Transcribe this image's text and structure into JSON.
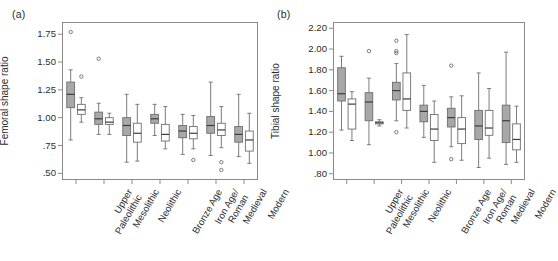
{
  "figure": {
    "panel_a_label": "(a)",
    "panel_b_label": "(b)"
  },
  "chart_data": [
    {
      "type": "box",
      "panel": "(a)",
      "title": "",
      "xlabel": "",
      "ylabel": "Femoral shape ratio",
      "ylim": [
        0.44,
        1.86
      ],
      "yticks": [
        0.5,
        0.75,
        1.0,
        1.25,
        1.5,
        1.75
      ],
      "ytick_labels": [
        ".50",
        ".75",
        "1.00",
        "1.25",
        "1.50",
        "1.75"
      ],
      "grid": false,
      "legend": "none",
      "categories": [
        "Upper Paleolithic",
        "Mesolithic",
        "Neolithic",
        "Bronze Age",
        "Iron Age/ Roman",
        "Medieval",
        "Modern"
      ],
      "category_label_lines": [
        [
          "Upper",
          "Paleolithic"
        ],
        [
          "Mesolithic",
          ""
        ],
        [
          "Neolithic",
          ""
        ],
        [
          "Bronze Age",
          ""
        ],
        [
          "Iron Age/",
          "Roman"
        ],
        [
          "Medieval",
          ""
        ],
        [
          "Modern",
          ""
        ]
      ],
      "series": [
        {
          "name": "male",
          "style": "shaded",
          "boxes": [
            {
              "category": "Upper Paleolithic",
              "whisker_low": 0.8,
              "q1": 1.09,
              "median": 1.21,
              "q3": 1.32,
              "whisker_high": 1.43,
              "outliers": [
                1.77
              ]
            },
            {
              "category": "Mesolithic",
              "whisker_low": 0.85,
              "q1": 0.94,
              "median": 0.99,
              "q3": 1.05,
              "whisker_high": 1.13,
              "outliers": [
                1.53
              ]
            },
            {
              "category": "Neolithic",
              "whisker_low": 0.6,
              "q1": 0.84,
              "median": 0.93,
              "q3": 1.0,
              "whisker_high": 1.21,
              "outliers": []
            },
            {
              "category": "Bronze Age",
              "whisker_low": 0.84,
              "q1": 0.95,
              "median": 0.99,
              "q3": 1.03,
              "whisker_high": 1.12,
              "outliers": []
            },
            {
              "category": "Iron Age/ Roman",
              "whisker_low": 0.67,
              "q1": 0.82,
              "median": 0.88,
              "q3": 0.93,
              "whisker_high": 1.03,
              "outliers": []
            },
            {
              "category": "Medieval",
              "whisker_low": 0.66,
              "q1": 0.86,
              "median": 0.93,
              "q3": 1.01,
              "whisker_high": 1.32,
              "outliers": []
            },
            {
              "category": "Modern",
              "whisker_low": 0.65,
              "q1": 0.78,
              "median": 0.85,
              "q3": 0.92,
              "whisker_high": 1.21,
              "outliers": []
            }
          ]
        },
        {
          "name": "female",
          "style": "open",
          "boxes": [
            {
              "category": "Upper Paleolithic",
              "whisker_low": 0.96,
              "q1": 1.03,
              "median": 1.07,
              "q3": 1.12,
              "whisker_high": 1.18,
              "outliers": [
                1.37
              ]
            },
            {
              "category": "Mesolithic",
              "whisker_low": 0.85,
              "q1": 0.94,
              "median": 0.96,
              "q3": 1.0,
              "whisker_high": 1.04,
              "outliers": []
            },
            {
              "category": "Neolithic",
              "whisker_low": 0.61,
              "q1": 0.78,
              "median": 0.86,
              "q3": 0.95,
              "whisker_high": 1.12,
              "outliers": []
            },
            {
              "category": "Bronze Age",
              "whisker_low": 0.72,
              "q1": 0.79,
              "median": 0.85,
              "q3": 0.94,
              "whisker_high": 1.1,
              "outliers": []
            },
            {
              "category": "Iron Age/ Roman",
              "whisker_low": 0.72,
              "q1": 0.81,
              "median": 0.86,
              "q3": 0.92,
              "whisker_high": 1.02,
              "outliers": [
                0.62
              ]
            },
            {
              "category": "Medieval",
              "whisker_low": 0.73,
              "q1": 0.84,
              "median": 0.89,
              "q3": 0.95,
              "whisker_high": 1.1,
              "outliers": [
                0.6,
                0.53
              ]
            },
            {
              "category": "Modern",
              "whisker_low": 0.59,
              "q1": 0.7,
              "median": 0.8,
              "q3": 0.88,
              "whisker_high": 1.04,
              "outliers": []
            }
          ]
        }
      ]
    },
    {
      "type": "box",
      "panel": "(b)",
      "title": "",
      "xlabel": "",
      "ylabel": "Tibial shape ratio",
      "ylim": [
        0.74,
        2.26
      ],
      "yticks": [
        0.8,
        1.0,
        1.2,
        1.4,
        1.6,
        1.8,
        2.0,
        2.2
      ],
      "ytick_labels": [
        ".80",
        "1.00",
        "1.20",
        "1.40",
        "1.60",
        "1.80",
        "2.00",
        "2.20"
      ],
      "grid": false,
      "legend": "none",
      "categories": [
        "Upper Paleolithic",
        "Mesolithic",
        "Neolithic",
        "Bronze Age",
        "Iron Age/ Roman",
        "Medieval",
        "Modern"
      ],
      "category_label_lines": [
        [
          "Upper",
          "Paleolithic"
        ],
        [
          "Mesolithic",
          ""
        ],
        [
          "Neolithic",
          ""
        ],
        [
          "Bronze Age",
          ""
        ],
        [
          "Iron Age/",
          "Roman"
        ],
        [
          "Medieval",
          ""
        ],
        [
          "Modern",
          ""
        ]
      ],
      "series": [
        {
          "name": "male",
          "style": "shaded",
          "boxes": [
            {
              "category": "Upper Paleolithic",
              "whisker_low": 1.22,
              "q1": 1.5,
              "median": 1.57,
              "q3": 1.82,
              "whisker_high": 1.93,
              "outliers": []
            },
            {
              "category": "Mesolithic",
              "whisker_low": 1.08,
              "q1": 1.31,
              "median": 1.49,
              "q3": 1.58,
              "whisker_high": 1.72,
              "outliers": [
                1.98
              ]
            },
            {
              "category": "Neolithic",
              "whisker_low": 1.31,
              "q1": 1.51,
              "median": 1.6,
              "q3": 1.68,
              "whisker_high": 1.86,
              "outliers": [
                2.08,
                1.98,
                1.96,
                1.2
              ]
            },
            {
              "category": "Bronze Age",
              "whisker_low": 1.15,
              "q1": 1.3,
              "median": 1.4,
              "q3": 1.46,
              "whisker_high": 1.65,
              "outliers": []
            },
            {
              "category": "Iron Age/ Roman",
              "whisker_low": 1.06,
              "q1": 1.25,
              "median": 1.34,
              "q3": 1.43,
              "whisker_high": 1.54,
              "outliers": [
                1.84,
                0.94
              ]
            },
            {
              "category": "Medieval",
              "whisker_low": 0.86,
              "q1": 1.13,
              "median": 1.26,
              "q3": 1.41,
              "whisker_high": 1.77,
              "outliers": []
            },
            {
              "category": "Modern",
              "whisker_low": 0.89,
              "q1": 1.1,
              "median": 1.31,
              "q3": 1.46,
              "whisker_high": 1.97,
              "outliers": []
            }
          ]
        },
        {
          "name": "female",
          "style": "open",
          "boxes": [
            {
              "category": "Upper Paleolithic",
              "whisker_low": 1.12,
              "q1": 1.23,
              "median": 1.47,
              "q3": 1.52,
              "whisker_high": 1.59,
              "outliers": []
            },
            {
              "category": "Mesolithic",
              "whisker_low": 1.26,
              "q1": 1.28,
              "median": 1.29,
              "q3": 1.3,
              "whisker_high": 1.32,
              "outliers": []
            },
            {
              "category": "Neolithic",
              "whisker_low": 1.24,
              "q1": 1.41,
              "median": 1.52,
              "q3": 1.77,
              "whisker_high": 2.14,
              "outliers": []
            },
            {
              "category": "Bronze Age",
              "whisker_low": 0.91,
              "q1": 1.12,
              "median": 1.23,
              "q3": 1.37,
              "whisker_high": 1.5,
              "outliers": []
            },
            {
              "category": "Iron Age/ Roman",
              "whisker_low": 0.93,
              "q1": 1.09,
              "median": 1.23,
              "q3": 1.34,
              "whisker_high": 1.55,
              "outliers": []
            },
            {
              "category": "Medieval",
              "whisker_low": 0.95,
              "q1": 1.17,
              "median": 1.24,
              "q3": 1.41,
              "whisker_high": 1.62,
              "outliers": []
            },
            {
              "category": "Modern",
              "whisker_low": 0.91,
              "q1": 1.03,
              "median": 1.13,
              "q3": 1.28,
              "whisker_high": 1.45,
              "outliers": []
            }
          ]
        }
      ]
    }
  ],
  "render": {
    "panel_a": {
      "plot_left": 62,
      "plot_top": 22,
      "plot_width": 196,
      "plot_height": 158
    },
    "panel_b": {
      "plot_left": 68,
      "plot_top": 22,
      "plot_width": 192,
      "plot_height": 158
    },
    "colors": {
      "shaded_fill": "#a8a8a8",
      "open_fill": "#ffffff",
      "stroke": "#6e6e6e",
      "frame": "#8a8a8a"
    }
  }
}
